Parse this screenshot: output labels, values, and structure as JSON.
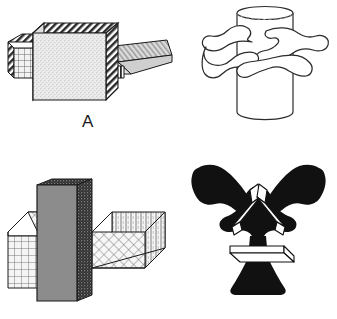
{
  "page": {
    "type": "line-drawing-figure-panel",
    "background_color": "#ffffff",
    "width": 337,
    "height": 319
  },
  "figures": [
    {
      "label": "A",
      "name": "figure-a",
      "description": "Interlocking block assembly: a large stippled cube in the center with a grid-textured rectangular bar projecting to the left and a flat diagonally-hatched wedge plate projecting to the right",
      "fill_primary": "#e8e8e8",
      "fill_secondary": "#d8d8d8",
      "stroke": "#1a1a1a",
      "textures": [
        "stipple",
        "grid",
        "diagonal-hatch",
        "vertical-stripe"
      ]
    },
    {
      "label": "B",
      "name": "figure-b",
      "description": "A solid gray vertical slab passing through two open-topped boxes, one on the left with grid-patterned front face and one on the right with cross-hatched faces",
      "fill_primary": "#8c8c8c",
      "fill_secondary": "#ffffff",
      "stroke": "#1a1a1a",
      "textures": [
        "solid-gray",
        "grid",
        "cross-hatch",
        "vertical-stripe",
        "stipple-edge"
      ]
    },
    {
      "label": "C",
      "name": "figure-c",
      "description": "An upright open cylinder with an irregular amoeba-like or hand-like organic form wrapped around its middle",
      "fill_primary": "#ffffff",
      "stroke": "#2b2b2b",
      "textures": [
        "outline-only"
      ]
    },
    {
      "label": "D",
      "name": "figure-d",
      "description": "A solid black silhouette resembling a winged trumpet form, with two flared horns angling upward and outward, a flared base pedestal, and thin white wireframe box shapes overlaid",
      "fill_primary": "#111111",
      "fill_secondary": "#ffffff",
      "stroke": "#111111",
      "textures": [
        "solid-black",
        "white-wireframe"
      ]
    }
  ],
  "labels": {
    "a": "A",
    "b": "B",
    "c": "C",
    "d": "D"
  }
}
